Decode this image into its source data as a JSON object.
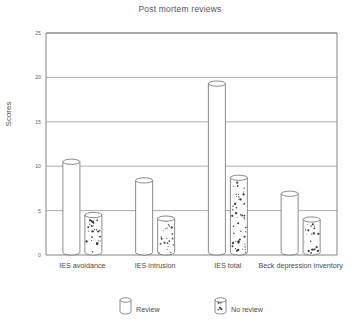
{
  "chart_data": {
    "type": "bar",
    "title": "Post mortem reviews",
    "xlabel": "",
    "ylabel": "Scores",
    "ylim": [
      0,
      25
    ],
    "yticks": [
      0,
      5,
      10,
      15,
      20,
      25
    ],
    "ytick_labels": [
      "0",
      "5",
      "10",
      "15",
      "20",
      "25"
    ],
    "grid": true,
    "legend_position": "bottom",
    "categories": [
      "IES avoidance",
      "IES intrusion",
      "IES total",
      "Beck depression inventory"
    ],
    "series": [
      {
        "name": "Review",
        "style": "plain-cylinder",
        "values": [
          10.5,
          8.4,
          19.3,
          6.9
        ]
      },
      {
        "name": "No review",
        "style": "speckled-cylinder",
        "values": [
          4.5,
          4.1,
          8.7,
          4.0
        ]
      }
    ]
  },
  "legend": {
    "items": [
      {
        "label": "Review"
      },
      {
        "label": "No review"
      }
    ]
  },
  "colors": {
    "axis": "#777777",
    "grid": "#8a8a8a",
    "bar_outline": "#6e6e6e",
    "bar_fill": "#ffffff",
    "speckle": "#3c3c3c",
    "text": "#4a4a4a",
    "title_text": "#555555",
    "background": "#ffffff"
  }
}
